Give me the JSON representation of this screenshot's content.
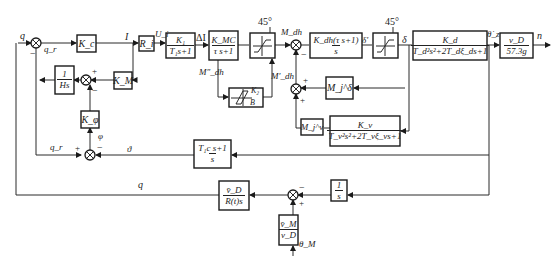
{
  "diagram": {
    "type": "control-system block diagram",
    "blocks": {
      "kc": {
        "label": "K_c"
      },
      "ri": {
        "label": "R_i"
      },
      "k1": {
        "num": "K₁",
        "den": "T₁s+1"
      },
      "kmc": {
        "num": "K_MC",
        "den": "τ s+1"
      },
      "sat1": {
        "label": "45°"
      },
      "kdh": {
        "num": "K_dh(τ s+1)",
        "den": "s"
      },
      "sat2": {
        "label": "45°"
      },
      "kd": {
        "num": "K_d",
        "den": "T_d²s²+2T_dξ_ds+1"
      },
      "vd": {
        "num": "v_D",
        "den": "57.3g"
      },
      "hs": {
        "num": "1",
        "den": "Hs"
      },
      "km": {
        "label": "K_M"
      },
      "kphi": {
        "label": "K_φ"
      },
      "hyst": {
        "k": "K₂",
        "b": "B"
      },
      "mjdelta": {
        "label": "M_j^δ"
      },
      "mjv": {
        "label": "M_j^v"
      },
      "kv": {
        "num": "K_v",
        "den": "T_v²s²+2T_vξ_vs+1"
      },
      "t1c": {
        "num": "T₁c s+1",
        "den": "s"
      },
      "vdr": {
        "num": "v̄_D",
        "den": "R(t)s"
      },
      "integ": {
        "num": "1",
        "den": "s"
      },
      "vm": {
        "num": "v̄_M",
        "den": "v_D"
      }
    },
    "signals": {
      "q_in": "q",
      "q_r": "q_r",
      "I": "I",
      "U_i": "U_i",
      "delta_I": "ΔI",
      "M_dh": "M_dh",
      "M_dh_pp": "M″_dh",
      "M_dh_p": "M′_dh",
      "delta_p": "δ′",
      "delta": "δ",
      "theta_dot": "θ̇_z",
      "n": "n",
      "phi": "φ",
      "theta": "ϑ",
      "q_r2": "q_r",
      "q_fb": "q",
      "theta_m": "θ_M",
      "sat1_angle": "45°",
      "sat2_angle": "45°"
    },
    "signs": {
      "sum1_minus": "−",
      "sum2_plus": "+",
      "sum2_minus": "−",
      "sumM_minus": "−",
      "sumMp_plus_top": "+",
      "sumMp_plus_bottom": "+",
      "sum3_plus": "+",
      "sum3_minus": "−",
      "sum4_minus": "−",
      "sum4_plus": "+"
    }
  }
}
